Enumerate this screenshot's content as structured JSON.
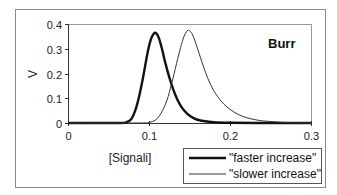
{
  "chart_data": {
    "type": "line",
    "title": "",
    "annotation": "Burr",
    "xlabel": "[Signali]",
    "ylabel": "V",
    "xlim": [
      0,
      0.3
    ],
    "ylim": [
      0,
      0.4
    ],
    "xticks": [
      0,
      0.1,
      0.2,
      0.3
    ],
    "xtick_labels": [
      "0",
      "0.1",
      "0.2",
      "0.3"
    ],
    "yticks": [
      0,
      0.1,
      0.2,
      0.3,
      0.4
    ],
    "ytick_labels": [
      "0",
      "0.1",
      "0.2",
      "0.3",
      "0.4"
    ],
    "grid": false,
    "legend_position": "bottom-right",
    "series": [
      {
        "name": "\"faster increase\"",
        "style": "thick",
        "color": "#111111",
        "x": [
          0,
          0.06,
          0.072,
          0.078,
          0.083,
          0.088,
          0.093,
          0.098,
          0.102,
          0.106,
          0.109,
          0.112,
          0.116,
          0.12,
          0.125,
          0.13,
          0.135,
          0.14,
          0.147,
          0.155,
          0.165,
          0.18,
          0.2,
          0.25,
          0.3
        ],
        "y": [
          0,
          0,
          0.003,
          0.015,
          0.05,
          0.11,
          0.19,
          0.28,
          0.335,
          0.362,
          0.362,
          0.345,
          0.3,
          0.245,
          0.185,
          0.135,
          0.095,
          0.065,
          0.038,
          0.02,
          0.009,
          0.003,
          0.001,
          0,
          0
        ]
      },
      {
        "name": "\"slower increase\"",
        "style": "thin",
        "color": "#333333",
        "x": [
          0,
          0.09,
          0.1,
          0.108,
          0.115,
          0.122,
          0.128,
          0.134,
          0.139,
          0.143,
          0.147,
          0.15,
          0.154,
          0.159,
          0.165,
          0.172,
          0.18,
          0.19,
          0.2,
          0.21,
          0.22,
          0.235,
          0.25,
          0.27,
          0.3
        ],
        "y": [
          0,
          0,
          0.003,
          0.012,
          0.04,
          0.09,
          0.16,
          0.24,
          0.305,
          0.348,
          0.372,
          0.373,
          0.355,
          0.31,
          0.25,
          0.185,
          0.13,
          0.085,
          0.055,
          0.035,
          0.022,
          0.011,
          0.006,
          0.002,
          0
        ]
      }
    ]
  }
}
